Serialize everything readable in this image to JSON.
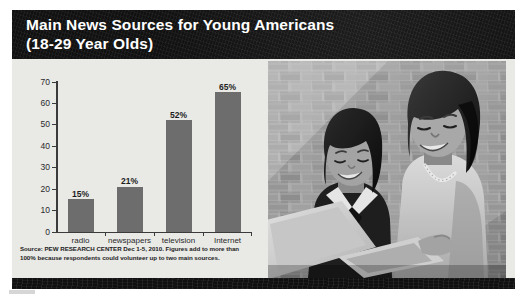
{
  "header": {
    "title_line1": "Main News Sources for Young Americans",
    "title_line2": "(18-29 Year Olds)",
    "background_color": "#111111",
    "text_color": "#ffffff"
  },
  "source_note": {
    "line1": "Source: PEW RESEARCH CENTER Dec 1-5, 2010. Figures add to more than 100% because",
    "line2": "respondents could volunteer up to two main sources."
  },
  "photo": {
    "alt": "Two young women smiling while looking at an open laptop in front of a brick wall",
    "subjects": [
      "young-woman-left",
      "young-woman-right",
      "laptop",
      "brick-wall"
    ],
    "style": "black-and-white"
  },
  "colors": {
    "panel_background": "#e9e9e6",
    "bar_fill": "#6d6d6d",
    "axis": "#3b3b3b",
    "header_band": "#111111",
    "footer_band": "#101010"
  },
  "chart_data": {
    "type": "bar",
    "title": "Main News Sources for Young Americans (18-29 Year Olds)",
    "subtitle": "",
    "categories": [
      "radio",
      "newspapers",
      "television",
      "Internet"
    ],
    "values": [
      15,
      21,
      52,
      65
    ],
    "data_labels": [
      "15%",
      "21%",
      "52%",
      "65%"
    ],
    "xlabel": "",
    "ylabel": "",
    "ylim": [
      0,
      70
    ],
    "yticks": [
      0,
      10,
      20,
      30,
      40,
      50,
      60,
      70
    ],
    "ytick_labels": [
      "0",
      "10",
      "20",
      "30",
      "40",
      "50",
      "60",
      "70"
    ],
    "grid": false,
    "legend": false,
    "series_color": "#6d6d6d",
    "units": "percent"
  }
}
